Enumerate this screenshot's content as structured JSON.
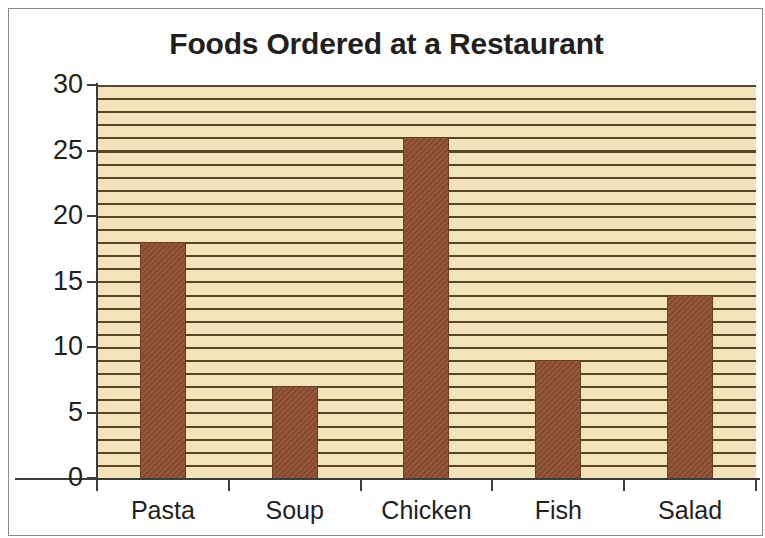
{
  "chart_data": {
    "type": "bar",
    "title": "Foods Ordered at a Restaurant",
    "xlabel": "",
    "ylabel": "",
    "categories": [
      "Pasta",
      "Soup",
      "Chicken",
      "Fish",
      "Salad"
    ],
    "values": [
      18,
      7,
      26,
      9,
      14
    ],
    "ylim": [
      0,
      30
    ],
    "y_ticks": [
      0,
      5,
      10,
      15,
      20,
      25,
      30
    ],
    "y_tick_labels": [
      "0",
      "5",
      "10",
      "15",
      "20",
      "25",
      "30"
    ],
    "grid": "horizontal-minor-every-1-unit",
    "legend": "none",
    "colors": {
      "bar": "#8d4e32",
      "plot_background": "#f3e3bb",
      "gridline": "#5a4526",
      "axis": "#3c3c3c",
      "text": "#231f20",
      "frame_border": "#8a8a8a"
    }
  }
}
